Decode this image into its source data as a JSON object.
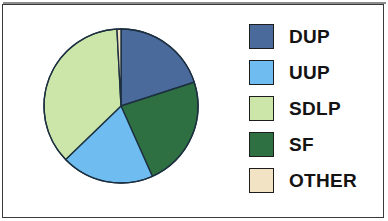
{
  "chart_data": {
    "type": "pie",
    "title": "",
    "subtitle": "",
    "xlabel": "",
    "ylabel": "",
    "legend_position": "right",
    "grid": false,
    "categories": [
      "DUP",
      "UUP",
      "SDLP",
      "SF",
      "OTHER"
    ],
    "values": [
      20,
      19.5,
      36.5,
      23,
      1
    ],
    "series": [
      {
        "name": "Seat share",
        "values": [
          20,
          19.5,
          36.5,
          23,
          1
        ]
      }
    ],
    "slice_order_clockwise_from_top": [
      "DUP",
      "SF",
      "UUP",
      "SDLP",
      "OTHER"
    ],
    "slice_angles_deg": {
      "DUP": 72,
      "SF": 84,
      "UUP": 70,
      "SDLP": 131,
      "OTHER": 3
    },
    "colors": {
      "DUP": "#4a6a9c",
      "UUP": "#6fbdf0",
      "SDLP": "#cbe6a8",
      "SF": "#2e7041",
      "OTHER": "#f2e3c4"
    },
    "slice_stroke": "#1d3040"
  },
  "legend": {
    "items": [
      {
        "label": "DUP",
        "color": "#4a6a9c",
        "swatch_name": "legend-swatch-dup"
      },
      {
        "label": "UUP",
        "color": "#6fbdf0",
        "swatch_name": "legend-swatch-uup"
      },
      {
        "label": "SDLP",
        "color": "#cbe6a8",
        "swatch_name": "legend-swatch-sdlp"
      },
      {
        "label": "SF",
        "color": "#2e7041",
        "swatch_name": "legend-swatch-sf"
      },
      {
        "label": "OTHER",
        "color": "#f2e3c4",
        "swatch_name": "legend-swatch-other"
      }
    ]
  },
  "canvas": {
    "background": "#ffffff",
    "frame_color": "#3a3a3a"
  }
}
